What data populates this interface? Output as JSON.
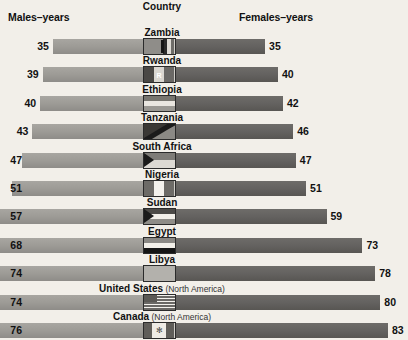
{
  "header": {
    "males_label": "Males–years",
    "females_label": "Females–years",
    "country_label": "Country"
  },
  "chart_data": {
    "type": "bar",
    "subtype": "paired-horizontal-bar",
    "title": "Country",
    "xlabel": "",
    "ylabel": "",
    "legend_position": "top",
    "grid": false,
    "series": [
      {
        "name": "Males–years",
        "values": [
          35,
          39,
          40,
          43,
          47,
          51,
          57,
          68,
          74,
          74,
          76
        ]
      },
      {
        "name": "Females–years",
        "values": [
          35,
          40,
          42,
          46,
          47,
          51,
          59,
          73,
          78,
          80,
          83
        ]
      }
    ],
    "categories": [
      "Zambia",
      "Rwanda",
      "Ethiopia",
      "Tanzania",
      "South Africa",
      "Nigeria",
      "Sudan",
      "Egypt",
      "Libya",
      "United States",
      "Canada"
    ],
    "annotations": [
      "United States (North America)",
      "Canada (North America)"
    ],
    "units": "years of life expectancy"
  },
  "rows": [
    {
      "country": "Zambia",
      "region": "",
      "male": 35,
      "female": 35,
      "male_text": "35",
      "female_text": "35",
      "flag": "zambia-flag"
    },
    {
      "country": "Rwanda",
      "region": "",
      "male": 39,
      "female": 40,
      "male_text": "39",
      "female_text": "40",
      "flag": "rwanda-flag"
    },
    {
      "country": "Ethiopia",
      "region": "",
      "male": 40,
      "female": 42,
      "male_text": "40",
      "female_text": "42",
      "flag": "ethiopia-flag"
    },
    {
      "country": "Tanzania",
      "region": "",
      "male": 43,
      "female": 46,
      "male_text": "43",
      "female_text": "46",
      "flag": "tanzania-flag"
    },
    {
      "country": "South Africa",
      "region": "",
      "male": 47,
      "female": 47,
      "male_text": "47",
      "female_text": "47",
      "flag": "south-africa-flag"
    },
    {
      "country": "Nigeria",
      "region": "",
      "male": 51,
      "female": 51,
      "male_text": "51",
      "female_text": "51",
      "flag": "nigeria-flag"
    },
    {
      "country": "Sudan",
      "region": "",
      "male": 57,
      "female": 59,
      "male_text": "57",
      "female_text": "59",
      "flag": "sudan-flag"
    },
    {
      "country": "Egypt",
      "region": "",
      "male": 68,
      "female": 73,
      "male_text": "68",
      "female_text": "73",
      "flag": "egypt-flag"
    },
    {
      "country": "Libya",
      "region": "",
      "male": 74,
      "female": 78,
      "male_text": "74",
      "female_text": "78",
      "flag": "libya-flag"
    },
    {
      "country": "United States",
      "region": "(North America)",
      "male": 74,
      "female": 80,
      "male_text": "74",
      "female_text": "80",
      "flag": "united-states-flag"
    },
    {
      "country": "Canada",
      "region": "(North America)",
      "male": 76,
      "female": 83,
      "male_text": "76",
      "female_text": "83",
      "flag": "canada-flag"
    }
  ],
  "colors": {
    "background": "#f2efe9",
    "male_bar": "#9d9b96",
    "female_bar": "#646260",
    "text": "#111111"
  }
}
